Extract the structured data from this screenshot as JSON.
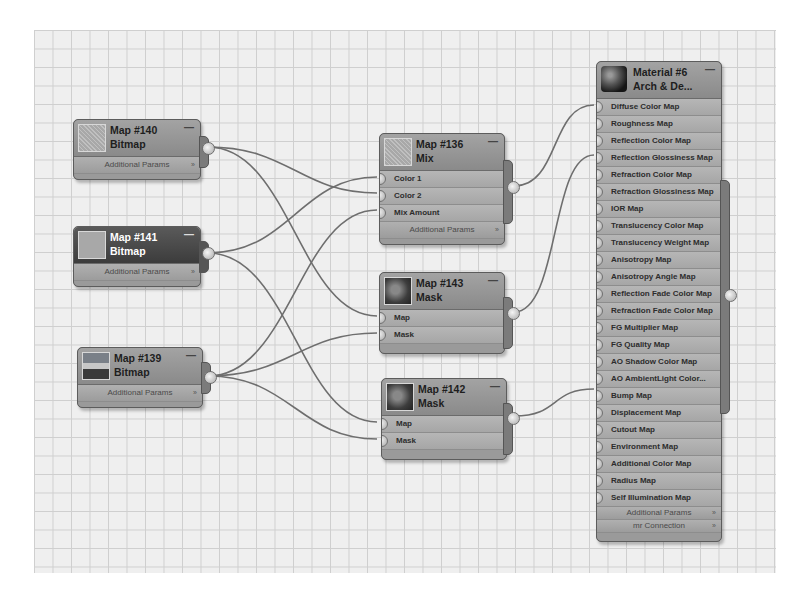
{
  "editor": {
    "canvas": "Slate Material Editor node view",
    "grid": true
  },
  "nodes": {
    "map140": {
      "title": "Map #140",
      "type": "Bitmap",
      "params_label": "Additional Params",
      "thumb": "noise-icon"
    },
    "map141": {
      "title": "Map #141",
      "type": "Bitmap",
      "params_label": "Additional Params",
      "thumb": "flat-texture-icon",
      "selected": true
    },
    "map139": {
      "title": "Map #139",
      "type": "Bitmap",
      "params_label": "Additional Params",
      "thumb": "photo-icon"
    },
    "map136": {
      "title": "Map #136",
      "type": "Mix",
      "inputs": [
        "Color 1",
        "Color 2",
        "Mix Amount"
      ],
      "params_label": "Additional Params"
    },
    "map143": {
      "title": "Map #143",
      "type": "Mask",
      "inputs": [
        "Map",
        "Mask"
      ]
    },
    "map142": {
      "title": "Map #142",
      "type": "Mask",
      "inputs": [
        "Map",
        "Mask"
      ]
    },
    "material6": {
      "title": "Material #6",
      "type": "Arch & De...",
      "inputs": [
        "Diffuse Color Map",
        "Roughness Map",
        "Reflection Color Map",
        "Reflection Glossiness Map",
        "Refraction Color Map",
        "Refraction Glossiness Map",
        "IOR Map",
        "Translucency Color Map",
        "Translucency Weight Map",
        "Anisotropy Map",
        "Anisotropy Angle Map",
        "Reflection Fade Color Map",
        "Refraction Fade Color Map",
        "FG Multiplier Map",
        "FG Quality Map",
        "AO Shadow Color Map",
        "AO AmbientLight Color...",
        "Bump Map",
        "Displacement Map",
        "Cutout Map",
        "Environment Map",
        "Additional Color Map",
        "Radius Map",
        "Self Illumination Map"
      ],
      "params_label": "Additional Params",
      "connection_label": "mr Connection"
    }
  },
  "ui": {
    "collapse_glyph": "—",
    "expand_glyph": "»"
  },
  "connections": [
    {
      "from": "Map #140",
      "to": "Map #136 / Color 2"
    },
    {
      "from": "Map #140",
      "to": "Map #143 / Map"
    },
    {
      "from": "Map #141",
      "to": "Map #136 / Color 1"
    },
    {
      "from": "Map #141",
      "to": "Map #142 / Map"
    },
    {
      "from": "Map #139",
      "to": "Map #136 / Mix Amount"
    },
    {
      "from": "Map #139",
      "to": "Map #143 / Mask"
    },
    {
      "from": "Map #139",
      "to": "Map #142 / Mask"
    },
    {
      "from": "Map #136",
      "to": "Material #6 / Diffuse Color Map"
    },
    {
      "from": "Map #143",
      "to": "Material #6 / Reflection Glossiness Map"
    },
    {
      "from": "Map #142",
      "to": "Material #6 / Bump Map"
    }
  ]
}
